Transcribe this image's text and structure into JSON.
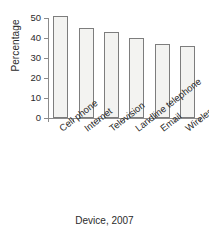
{
  "chart_data": {
    "type": "bar",
    "title": "",
    "categories": [
      "Cell phone",
      "Internet",
      "Television",
      "Landline telephone",
      "Email",
      "Wireless email device"
    ],
    "values": [
      51,
      45,
      43,
      40,
      37,
      36
    ],
    "xlabel": "Device, 2007",
    "ylabel": "Percentage",
    "ylim": [
      0,
      50
    ],
    "yticks": [
      0,
      10,
      20,
      30,
      40,
      50
    ],
    "ytick_labels": [
      "0",
      "10",
      "20",
      "30",
      "40",
      "50"
    ],
    "grid": false,
    "legend": null,
    "bar_fill_color": "#f3f3f1",
    "bar_edge_color": "#7d7d7d",
    "axis_color": "#8b8b8b",
    "text_color": "#2b2b2b"
  }
}
